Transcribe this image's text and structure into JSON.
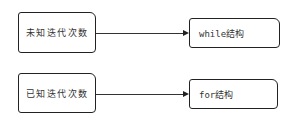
{
  "diagram": {
    "rows": [
      {
        "condition": "未知迭代次数",
        "structure": "while结构"
      },
      {
        "condition": "已知迭代次数",
        "structure": "for结构"
      }
    ],
    "edge_style": "arrow",
    "colors": {
      "stroke": "#222222",
      "background": "#ffffff",
      "text": "#333333"
    }
  }
}
